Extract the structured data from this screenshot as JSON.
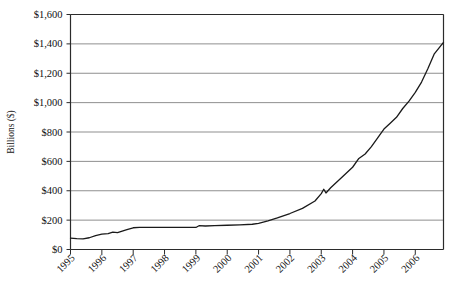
{
  "chart_data": {
    "type": "line",
    "title": "",
    "xlabel": "",
    "ylabel": "Billions ($)",
    "grid": true,
    "legend": false,
    "xlim": [
      1995,
      2006.9
    ],
    "ylim": [
      0,
      1600
    ],
    "y_tick_labels": [
      "$1,600",
      "$1,400",
      "$1,200",
      "$1,000",
      "$800",
      "$600",
      "$400",
      "$200",
      "$0"
    ],
    "y_tick_values": [
      1600,
      1400,
      1200,
      1000,
      800,
      600,
      400,
      200,
      0
    ],
    "x_tick_labels": [
      "1995",
      "1996",
      "1997",
      "1998",
      "1999",
      "2000",
      "2001",
      "2002",
      "2003",
      "2004",
      "2005",
      "2006"
    ],
    "x_tick_values": [
      1995,
      1996,
      1997,
      1998,
      1999,
      2000,
      2001,
      2002,
      2003,
      2004,
      2005,
      2006
    ],
    "series": [
      {
        "name": "Total",
        "color": "#1a1a1a",
        "x": [
          1995.0,
          1995.2,
          1995.4,
          1995.6,
          1995.8,
          1996.0,
          1996.2,
          1996.35,
          1996.5,
          1996.65,
          1996.8,
          1997.0,
          1997.2,
          1997.5,
          1998.0,
          1998.5,
          1999.0,
          1999.1,
          1999.3,
          1999.6,
          2000.0,
          2000.4,
          2000.8,
          2001.0,
          2001.3,
          2001.6,
          2002.0,
          2002.4,
          2002.8,
          2003.0,
          2003.08,
          2003.15,
          2003.3,
          2003.6,
          2004.0,
          2004.2,
          2004.4,
          2004.6,
          2004.8,
          2005.0,
          2005.2,
          2005.4,
          2005.6,
          2005.8,
          2006.0,
          2006.2,
          2006.4,
          2006.6,
          2006.9
        ],
        "values": [
          78,
          74,
          72,
          80,
          95,
          105,
          108,
          118,
          115,
          125,
          135,
          148,
          150,
          150,
          150,
          150,
          150,
          162,
          160,
          162,
          165,
          168,
          172,
          178,
          195,
          215,
          245,
          280,
          330,
          380,
          410,
          385,
          420,
          480,
          560,
          620,
          650,
          700,
          760,
          820,
          860,
          900,
          960,
          1010,
          1070,
          1140,
          1230,
          1330,
          1410
        ]
      }
    ],
    "annotations": [
      {
        "label": "spike near 2003 at about $400 billion",
        "x": 2003.08,
        "y": 410
      }
    ]
  },
  "axis_style": {
    "axis_color": "#2b2b2b",
    "grid_color": "#8f8f8f",
    "background": "#ffffff",
    "line_color": "#1a1a1a"
  }
}
